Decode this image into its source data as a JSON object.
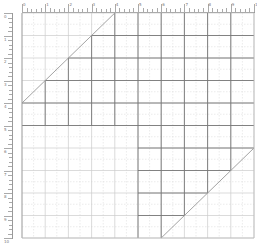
{
  "canvas": {
    "name": "graph-paper-canvas",
    "left": 22,
    "top": 13,
    "right": 254,
    "bottom": 238,
    "columns": 10,
    "rows": 10,
    "colors": {
      "major": "#aaaaaa",
      "minor": "#dddddd",
      "dark": "#777777",
      "diagonal": "#999999"
    }
  },
  "rulers": {
    "top_labels": [
      "0",
      "1",
      "2",
      "3",
      "4",
      "5",
      "6",
      "7",
      "8",
      "9",
      "10"
    ],
    "left_labels": [
      "0",
      "1",
      "2",
      "3",
      "4",
      "5",
      "6",
      "7",
      "8",
      "9",
      "10"
    ]
  }
}
